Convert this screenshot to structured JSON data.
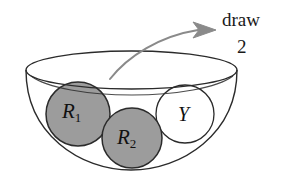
{
  "figure": {
    "background_color": "#ffffff",
    "annotation": {
      "action_label": "draw",
      "count_label": "2",
      "arrow_icon_name": "curved-arrow-icon",
      "arrow_color": "#8a8a8a"
    },
    "container": {
      "name": "bowl",
      "outline_color": "#2b2b2b",
      "fill_color": "#ffffff"
    },
    "balls": [
      {
        "id": "R1",
        "label": "R",
        "subscript": "1",
        "color_name": "red-shaded",
        "fill_color": "#9c9c9c",
        "outline_color": "#2b2b2b",
        "cx": 78,
        "cy": 114,
        "r": 32
      },
      {
        "id": "R2",
        "label": "R",
        "subscript": "2",
        "color_name": "red-shaded",
        "fill_color": "#9c9c9c",
        "outline_color": "#2b2b2b",
        "cx": 132,
        "cy": 138,
        "r": 30
      },
      {
        "id": "Y",
        "label": "Y",
        "subscript": "",
        "color_name": "yellow-unshaded",
        "fill_color": "#ffffff",
        "outline_color": "#2b2b2b",
        "cx": 185,
        "cy": 114,
        "r": 29
      }
    ]
  }
}
